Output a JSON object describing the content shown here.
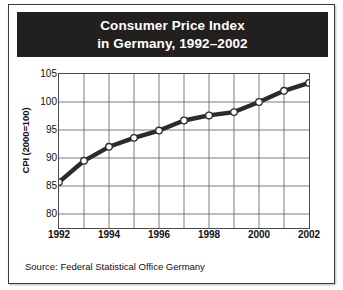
{
  "figure": {
    "title_line1": "Consumer Price Index",
    "title_line2": "in Germany, 1992–2002",
    "source": "Source: Federal Statistical Office Germany",
    "title_band_color": "#221f1f",
    "line_color": "#2b2b2b",
    "marker_fill": "#ffffff",
    "grid_color": "#6e6e6e",
    "background": "#ffffff"
  },
  "chart_data": {
    "type": "line",
    "title": "Consumer Price Index in Germany, 1992–2002",
    "xlabel": "",
    "ylabel": "CPI (2000=100)",
    "x": [
      1992,
      1993,
      1994,
      1995,
      1996,
      1997,
      1998,
      1999,
      2000,
      2001,
      2002
    ],
    "values": [
      85.7,
      89.5,
      92.0,
      93.6,
      94.9,
      96.7,
      97.6,
      98.2,
      100.0,
      102.0,
      103.4
    ],
    "xtick_labels": [
      "1992",
      "1994",
      "1996",
      "1998",
      "2000",
      "2002"
    ],
    "xtick_values": [
      1992,
      1994,
      1996,
      1998,
      2000,
      2002
    ],
    "ytick_labels": [
      "80",
      "85",
      "90",
      "95",
      "100",
      "105"
    ],
    "ytick_values": [
      80,
      85,
      90,
      95,
      100,
      105
    ],
    "xlim": [
      1992,
      2002
    ],
    "ylim": [
      77.5,
      105
    ],
    "grid": true,
    "legend": "none",
    "marker": "circle",
    "annotations": [
      "Source: Federal Statistical Office Germany"
    ]
  }
}
